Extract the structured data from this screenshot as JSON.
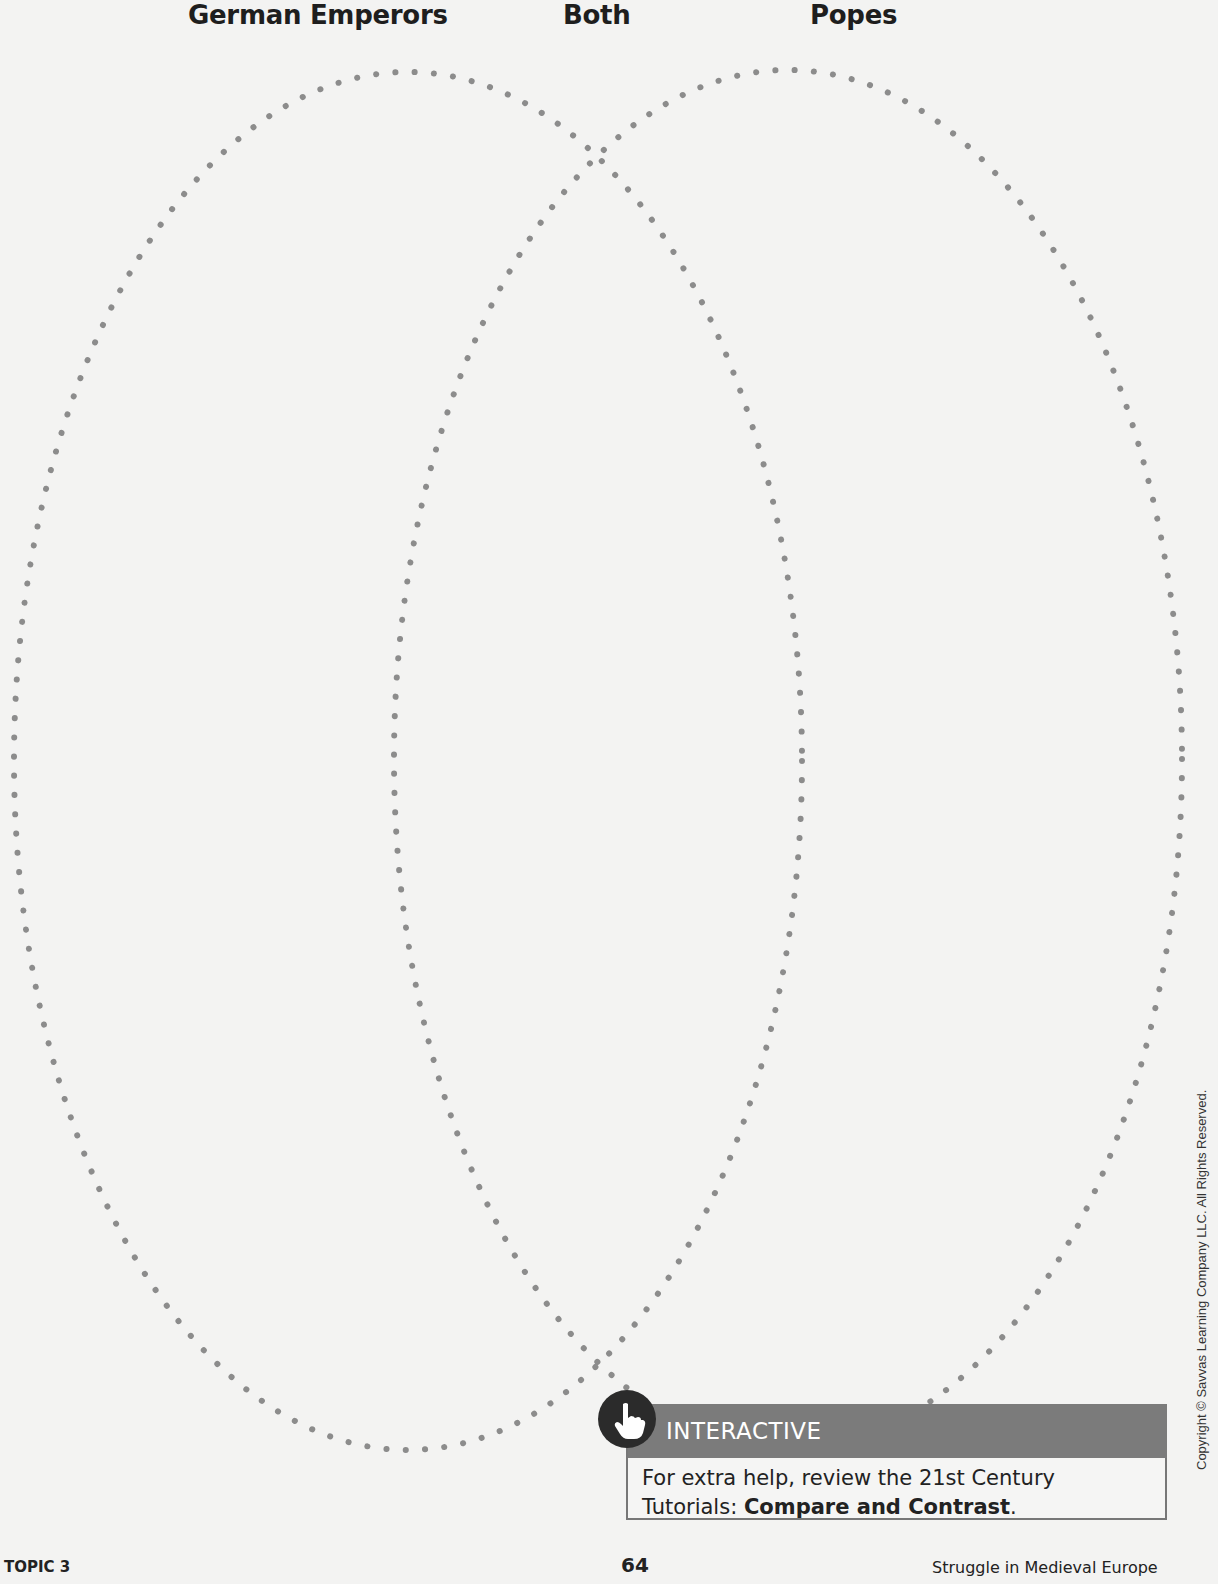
{
  "venn": {
    "labels": {
      "left": "German Emperors",
      "center": "Both",
      "right": "Popes"
    },
    "left_ellipse": {
      "cx": 408,
      "cy": 761,
      "rx": 394,
      "ry": 689
    },
    "right_ellipse": {
      "cx": 788,
      "cy": 759,
      "rx": 394,
      "ry": 689
    },
    "dot_color": "#8c8c8c"
  },
  "interactive": {
    "icon": "hand-pointer-icon",
    "title": "INTERACTIVE",
    "body_prefix": "For extra help, review the 21st Century Tutorials: ",
    "body_bold": "Compare and Contrast",
    "body_suffix": ".",
    "header_color": "#7b7b7b"
  },
  "footer": {
    "left": "TOPIC 3",
    "page_number": "64",
    "right": "Struggle in Medieval Europe"
  },
  "copyright": "Copyright © Savvas Learning Company LLC. All Rights Reserved."
}
